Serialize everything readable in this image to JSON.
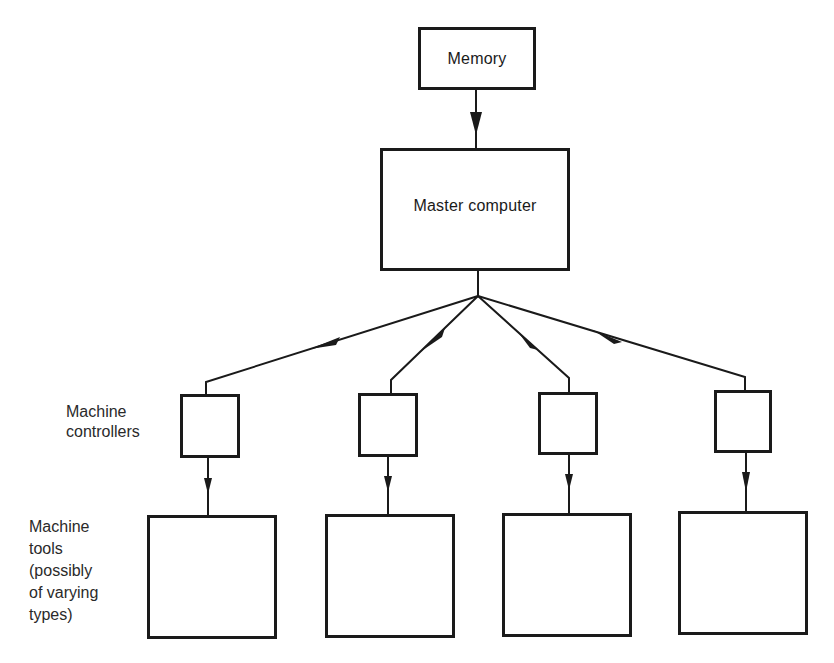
{
  "diagram": {
    "memory": {
      "label": "Memory"
    },
    "master": {
      "label": "Master computer"
    },
    "controllers_label": "Machine\ncontrollers",
    "tools_label": "Machine\ntools\n(possibly\nof varying\ntypes)",
    "controllers": [
      {
        "id": "controller-1",
        "label": ""
      },
      {
        "id": "controller-2",
        "label": ""
      },
      {
        "id": "controller-3",
        "label": ""
      },
      {
        "id": "controller-4",
        "label": ""
      }
    ],
    "tools": [
      {
        "id": "tool-1",
        "label": ""
      },
      {
        "id": "tool-2",
        "label": ""
      },
      {
        "id": "tool-3",
        "label": ""
      },
      {
        "id": "tool-4",
        "label": ""
      }
    ],
    "line_color": "#1a1a1a"
  }
}
